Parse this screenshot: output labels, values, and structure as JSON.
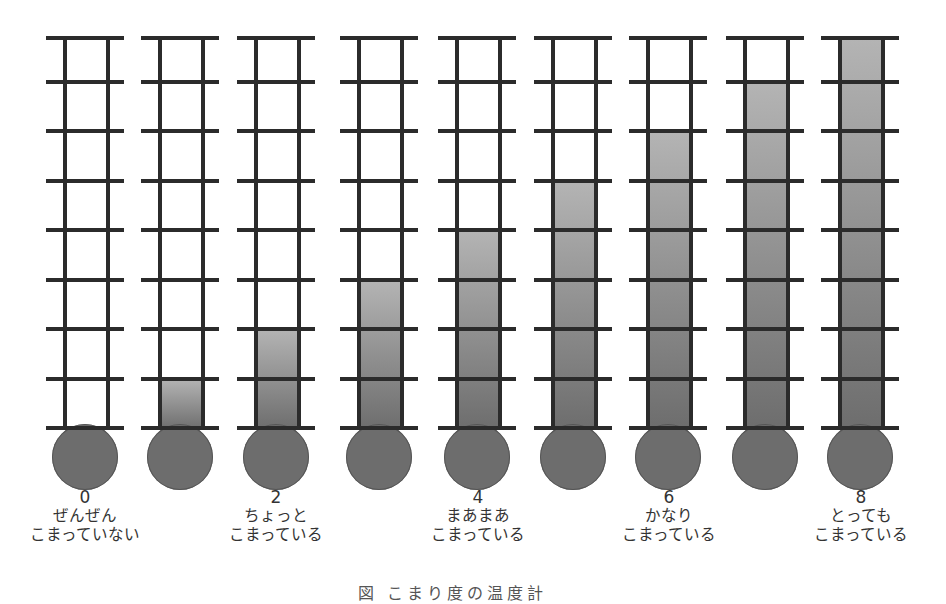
{
  "diagram": {
    "type": "thermometer-scale",
    "max_level": 8,
    "rung_count": 9,
    "colors": {
      "frame": "#2b2b2b",
      "fill_top": "#b4b4b4",
      "fill_bottom": "#6d6d6d",
      "bulb": "#6d6d6d",
      "background": "#ffffff"
    },
    "thermometers": [
      {
        "level": 0
      },
      {
        "level": 1
      },
      {
        "level": 2
      },
      {
        "level": 3
      },
      {
        "level": 4
      },
      {
        "level": 5
      },
      {
        "level": 6
      },
      {
        "level": 7
      },
      {
        "level": 8
      }
    ],
    "labels": [
      {
        "value": "0",
        "line1": "ぜんぜん",
        "line2": "こまっていない",
        "column": 0
      },
      {
        "value": "2",
        "line1": "ちょっと",
        "line2": "こまっている",
        "column": 2
      },
      {
        "value": "4",
        "line1": "まあまあ",
        "line2": "こまっている",
        "column": 4
      },
      {
        "value": "6",
        "line1": "かなり",
        "line2": "こまっている",
        "column": 6
      },
      {
        "value": "8",
        "line1": "とっても",
        "line2": "こまっている",
        "column": 8
      }
    ],
    "caption": "図 こまり度の温度計"
  }
}
